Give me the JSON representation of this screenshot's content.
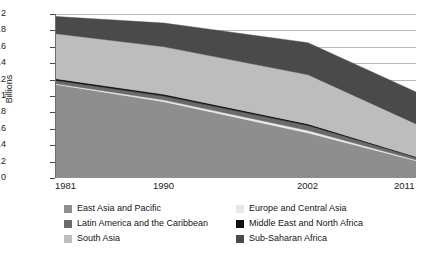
{
  "chart_data": {
    "type": "area",
    "title": "",
    "subtitle": "",
    "xlabel": "",
    "ylabel": "Billions",
    "x": [
      1981,
      1990,
      2002,
      2011
    ],
    "categories": [
      "1981",
      "1990",
      "2002",
      "2011"
    ],
    "xtick_labels": [
      "1981",
      "1990",
      "2002",
      "2011"
    ],
    "ytick_labels": [
      "0",
      "0.2",
      "0.4",
      "0.6",
      "0.8",
      "1",
      "1.2",
      "1.4",
      "1.6",
      "1.8",
      "2"
    ],
    "ytick_values": [
      0,
      0.2,
      0.4,
      0.6,
      0.8,
      1,
      1.2,
      1.4,
      1.6,
      1.8,
      2
    ],
    "ylim": [
      0,
      2
    ],
    "xlim": [
      1981,
      2011
    ],
    "grid": true,
    "grid_axis": "y",
    "stacked": true,
    "legend_position": "bottom",
    "legend_columns": 2,
    "series": [
      {
        "name": "East Asia and Pacific",
        "color": "#8e8e8e",
        "values": [
          1.14,
          0.93,
          0.55,
          0.21
        ]
      },
      {
        "name": "Europe and Central Asia",
        "color": "#e8e8e8",
        "values": [
          0.01,
          0.02,
          0.03,
          0.01
        ]
      },
      {
        "name": "Latin America and the Caribbean",
        "color": "#6b6b6b",
        "values": [
          0.04,
          0.05,
          0.06,
          0.03
        ]
      },
      {
        "name": "Middle East and North Africa",
        "color": "#111111",
        "values": [
          0.02,
          0.02,
          0.02,
          0.01
        ]
      },
      {
        "name": "South Asia",
        "color": "#bdbdbd",
        "values": [
          0.55,
          0.58,
          0.6,
          0.4
        ]
      },
      {
        "name": "Sub-Saharan Africa",
        "color": "#4a4a4a",
        "values": [
          0.21,
          0.29,
          0.39,
          0.39
        ]
      }
    ],
    "totals": [
      1.97,
      1.89,
      1.65,
      1.05
    ]
  },
  "axis": {
    "y_title": "Billions"
  },
  "legend": {
    "items": [
      {
        "label": "East Asia and Pacific",
        "color": "#8e8e8e"
      },
      {
        "label": "Europe and Central Asia",
        "color": "#e8e8e8"
      },
      {
        "label": "Latin America and the Caribbean",
        "color": "#6b6b6b"
      },
      {
        "label": "Middle East and North Africa",
        "color": "#111111"
      },
      {
        "label": "South Asia",
        "color": "#bdbdbd"
      },
      {
        "label": "Sub-Saharan Africa",
        "color": "#4a4a4a"
      }
    ]
  }
}
